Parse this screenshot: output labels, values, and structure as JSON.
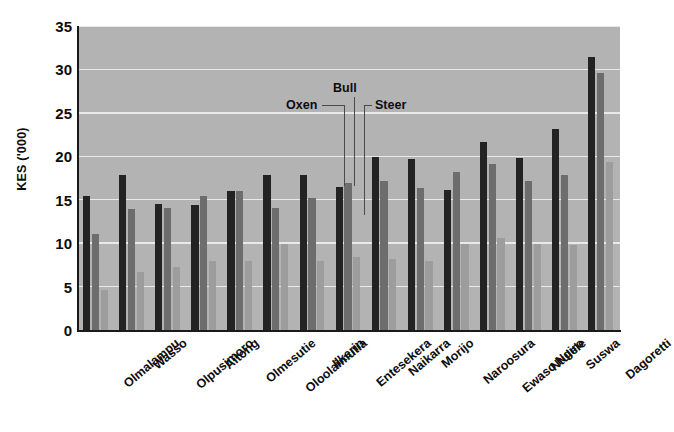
{
  "chart_data": {
    "type": "bar",
    "title": "",
    "subtitle": "",
    "xlabel": "",
    "ylabel": "KES ('000)",
    "ylim": [
      0,
      35
    ],
    "yticks": [
      0,
      5,
      10,
      15,
      20,
      25,
      30,
      35
    ],
    "ytick_labels": [
      "0",
      "5",
      "10",
      "15",
      "20",
      "25",
      "30",
      "35"
    ],
    "grid": true,
    "grid_axis": "y",
    "legend_position": "annotated-inline",
    "categories": [
      "Olmalampu",
      "Wasso",
      "Olpusimoro",
      "Aitong",
      "Olmesutie",
      "Oloolaimutia",
      "Ilkerin",
      "Entesekera",
      "Naikarra",
      "Morijo",
      "Naroosura",
      "Ewaso Ngiro",
      "Ntulele",
      "Suswa",
      "Dagoretti"
    ],
    "series": [
      {
        "name": "Oxen",
        "color": "#232323",
        "values": [
          15.4,
          17.9,
          14.5,
          14.4,
          16.0,
          17.8,
          17.9,
          16.5,
          19.9,
          19.7,
          16.1,
          21.7,
          19.8,
          23.2,
          31.4
        ]
      },
      {
        "name": "Bull",
        "color": "#6d6d6d",
        "values": [
          11.0,
          13.9,
          14.0,
          15.4,
          16.0,
          14.0,
          15.2,
          16.9,
          17.1,
          16.4,
          18.2,
          19.1,
          17.2,
          17.9,
          29.6
        ]
      },
      {
        "name": "Steer",
        "color": "#9d9d9d",
        "values": [
          4.6,
          6.7,
          7.2,
          8.0,
          8.0,
          9.9,
          8.0,
          8.4,
          8.2,
          8.0,
          9.9,
          10.6,
          9.9,
          9.8,
          19.3
        ]
      }
    ],
    "annotations": [
      {
        "text": "Oxen",
        "target_category": "Entesekera",
        "target_series": "Oxen"
      },
      {
        "text": "Bull",
        "target_category": "Entesekera",
        "target_series": "Bull"
      },
      {
        "text": "Steer",
        "target_category": "Entesekera",
        "target_series": "Steer"
      }
    ]
  },
  "axes": {
    "y_title": "KES ('000)"
  }
}
